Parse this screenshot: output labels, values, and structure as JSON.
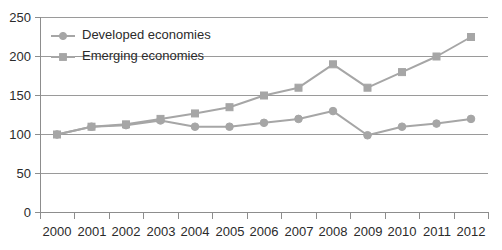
{
  "chart_data": {
    "type": "line",
    "title": "",
    "subtitle": "",
    "xlabel": "",
    "ylabel": "",
    "categories": [
      "2000",
      "2001",
      "2002",
      "2003",
      "2004",
      "2005",
      "2006",
      "2007",
      "2008",
      "2009",
      "2010",
      "2011",
      "2012"
    ],
    "x": [
      2000,
      2001,
      2002,
      2003,
      2004,
      2005,
      2006,
      2007,
      2008,
      2009,
      2010,
      2011,
      2012
    ],
    "series": [
      {
        "name": "Developed economies",
        "marker": "circle",
        "color": "#a6a6a6",
        "values": [
          100,
          110,
          112,
          118,
          110,
          110,
          115,
          120,
          130,
          99,
          110,
          114,
          120
        ]
      },
      {
        "name": "Emerging economies",
        "marker": "square",
        "color": "#a6a6a6",
        "values": [
          100,
          110,
          113,
          120,
          127,
          135,
          150,
          160,
          190,
          160,
          180,
          200,
          225
        ]
      }
    ],
    "ylim": [
      0,
      250
    ],
    "yticks": [
      0,
      50,
      100,
      150,
      200,
      250
    ],
    "ytick_labels": [
      "0",
      "50",
      "100",
      "150",
      "200",
      "250"
    ],
    "xtick_labels": [
      "2000",
      "2001",
      "2002",
      "2003",
      "2004",
      "2005",
      "2006",
      "2007",
      "2008",
      "2009",
      "2010",
      "2011",
      "2012"
    ],
    "grid": true,
    "grid_axis": "y",
    "legend_position": "top-left",
    "legend_entries": [
      "Developed economies",
      "Emerging economies"
    ]
  },
  "legend": {
    "items": [
      {
        "label": "Developed economies",
        "marker": "circle-marker-icon"
      },
      {
        "label": "Emerging economies",
        "marker": "square-marker-icon"
      }
    ]
  },
  "axes": {
    "y_labels": [
      "250",
      "200",
      "150",
      "100",
      "50",
      "0"
    ],
    "x_labels": [
      "2000",
      "2001",
      "2002",
      "2003",
      "2004",
      "2005",
      "2006",
      "2007",
      "2008",
      "2009",
      "2010",
      "2011",
      "2012"
    ]
  },
  "colors": {
    "series": "#a6a6a6",
    "grid": "#9a9a9a",
    "axis": "#8d8d8d",
    "text": "#2b2b2b",
    "background": "#ffffff"
  }
}
